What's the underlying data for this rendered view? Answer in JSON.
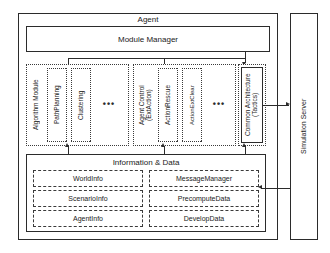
{
  "diagram": {
    "title": "Agent",
    "outer": {
      "agent_label": "Agent",
      "simulation_server_label": "Simulation Server"
    },
    "module_manager": {
      "label": "Module Manager"
    },
    "groups": [
      {
        "id": "algorithm-module",
        "label": "Algorithm Module",
        "items": [
          {
            "label": "PathPlanning"
          },
          {
            "label": "Clustering"
          }
        ],
        "ellipsis": "•••"
      },
      {
        "id": "agent-control",
        "label": "Agent Control\n(ExtAction)",
        "items": [
          {
            "label": "ActionRescue"
          },
          {
            "label": "ActionExtClear"
          }
        ],
        "ellipsis": "•••"
      },
      {
        "id": "common-architecture",
        "label": "Common Architecture\n(Tactics)",
        "items": [],
        "ellipsis": ""
      }
    ],
    "information_data": {
      "label": "Information & Data",
      "left_column": [
        {
          "label": "WorldInfo"
        },
        {
          "label": "ScenarioInfo"
        },
        {
          "label": "AgentInfo"
        }
      ],
      "right_column": [
        {
          "label": "MessageManager"
        },
        {
          "label": "PrecomputeData"
        },
        {
          "label": "DevelopData"
        }
      ]
    },
    "colors": {
      "stroke": "#2b2b2b",
      "hatch": "#8d8d8d",
      "background": "#ffffff"
    }
  }
}
